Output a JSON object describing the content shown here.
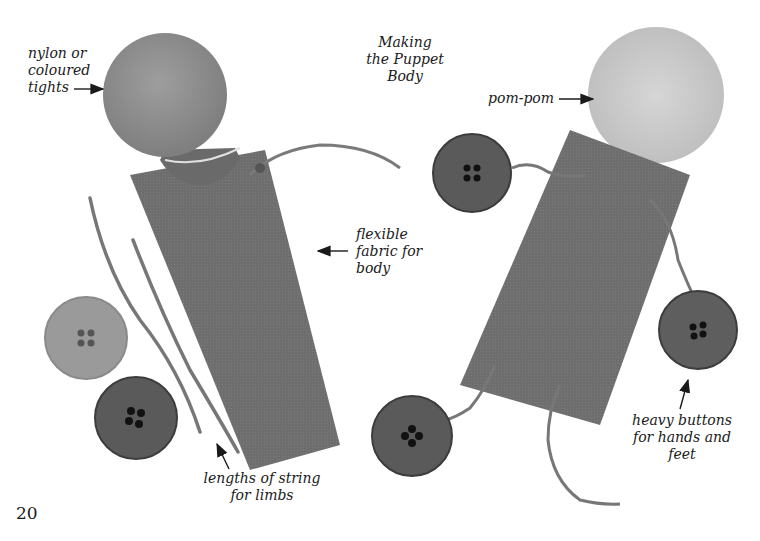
{
  "page": {
    "title": "Making\nthe Puppet\nBody",
    "page_number": "20"
  },
  "labels": {
    "head_material": "nylon or\ncoloured\ntights",
    "pom_pom": "pom-pom",
    "body_fabric": "flexible\nfabric for\nbody",
    "limbs": "lengths of string\nfor limbs",
    "buttons": "heavy buttons\nfor hands and\nfeet"
  },
  "colors": {
    "ink": "#1a1a1a",
    "fabric": "#6e6e6e",
    "head": "#8f8f8f",
    "pompom": "#cfcfcf",
    "button_dark": "#5a5a5a",
    "button_light": "#9a9a9a",
    "string": "#7a7a7a"
  }
}
